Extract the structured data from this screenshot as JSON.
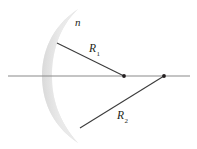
{
  "figure": {
    "kind": "optics-ray-diagram",
    "background_color": "#ffffff"
  },
  "labels": {
    "refractive_index": {
      "text": "n",
      "x": 75,
      "y": 26,
      "font_size": 11
    },
    "radius_1": {
      "base": "R",
      "subscript": "1",
      "x": 89,
      "y": 52,
      "font_size": 11
    },
    "radius_2": {
      "base": "R",
      "subscript": "2",
      "x": 117,
      "y": 119,
      "font_size": 11
    }
  },
  "axis": {
    "name": "optical-axis",
    "x1": 8,
    "y1": 76,
    "x2": 190,
    "y2": 76,
    "color": "#808080",
    "width": 1.2
  },
  "lens": {
    "name": "meniscus-lens",
    "fill_light": "#f2f2f2",
    "fill_mid": "#d9d9d9",
    "fill_edge": "#c8c8c8",
    "outer_arc": "M 78,9 C 50,28 42,54 42,76 C 42,98 50,124 78,143",
    "inner_arc": "M 78,143 C 58,120 52,98 52,76 C 52,54 58,28 78,9"
  },
  "radius_lines": [
    {
      "name": "radius-1-line",
      "x1": 57,
      "y1": 43,
      "x2": 124,
      "y2": 76,
      "color": "#3c3c3c",
      "width": 1.1
    },
    {
      "name": "radius-2-line",
      "x1": 80,
      "y1": 128,
      "x2": 164,
      "y2": 76,
      "color": "#3c3c3c",
      "width": 1.1
    }
  ],
  "center_points": [
    {
      "name": "center-of-curvature-1",
      "cx": 124,
      "cy": 76,
      "r": 1.9,
      "color": "#231f20"
    },
    {
      "name": "center-of-curvature-2",
      "cx": 164,
      "cy": 76,
      "r": 1.9,
      "color": "#231f20"
    }
  ]
}
